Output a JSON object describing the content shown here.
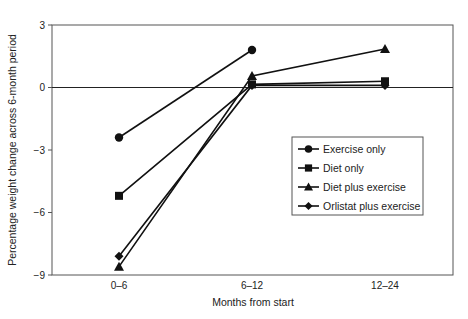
{
  "chart_data": {
    "type": "line",
    "title": "",
    "xlabel": "Months from start",
    "ylabel": "Percentage weight change across 6-month period",
    "categories": [
      "0–6",
      "6–12",
      "12–24"
    ],
    "ylim": [
      -9,
      3
    ],
    "yticks": [
      3,
      0,
      -3,
      -6,
      -9
    ],
    "ytick_labels": [
      "3",
      "0",
      "−3",
      "−6",
      "−9"
    ],
    "grid": false,
    "zero_line": true,
    "legend_position": "inside-right",
    "series": [
      {
        "name": "Exercise only",
        "marker": "circle",
        "values": [
          -2.4,
          1.8,
          null
        ]
      },
      {
        "name": "Diet only",
        "marker": "square",
        "values": [
          -5.2,
          0.15,
          0.3
        ]
      },
      {
        "name": "Diet plus exercise",
        "marker": "triangle",
        "values": [
          -8.6,
          0.55,
          1.85
        ]
      },
      {
        "name": "Orlistat plus exercise",
        "marker": "diamond",
        "values": [
          -8.1,
          0.1,
          0.1
        ]
      }
    ]
  },
  "colors": {
    "line": "#111111",
    "axis": "#555555"
  }
}
